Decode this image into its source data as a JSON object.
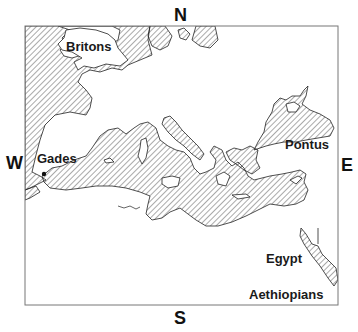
{
  "map": {
    "style": "monochrome line map, seas hatched with diagonal lines, land left white",
    "region": "Mediterranean and surrounding seas",
    "colors": {
      "ink": "#1a1a1a",
      "hatch": "#555555",
      "frame": "#777777",
      "land": "#ffffff"
    },
    "compass": {
      "north": "N",
      "south": "S",
      "west": "W",
      "east": "E"
    },
    "labels": {
      "britons": "Britons",
      "gades": "Gades",
      "pontus": "Pontus",
      "egypt": "Egypt",
      "aethiopians": "Aethiopians"
    },
    "markers": [
      {
        "name": "Gades",
        "type": "city-dot"
      }
    ]
  }
}
